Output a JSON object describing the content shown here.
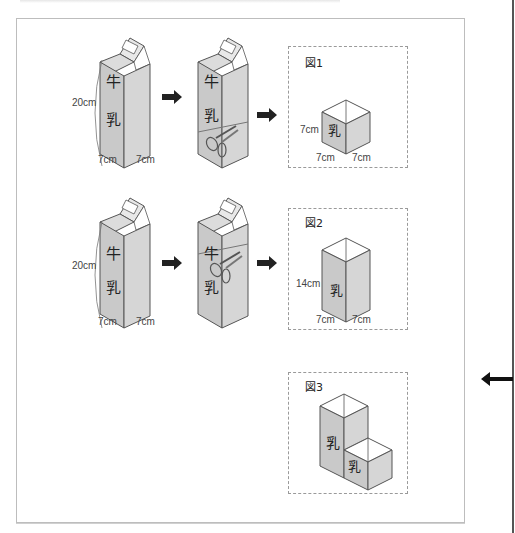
{
  "row1": {
    "carton_label_top": "牛",
    "carton_label_bottom": "乳",
    "height_label": "20cm",
    "width_left": "7cm",
    "width_right": "7cm",
    "figure": {
      "label": "図1",
      "height_label": "7cm",
      "width_left": "7cm",
      "width_right": "7cm",
      "carton_text": "乳"
    }
  },
  "row2": {
    "carton_label_top": "牛",
    "carton_label_bottom": "乳",
    "height_label": "20cm",
    "width_left": "7cm",
    "width_right": "7cm",
    "figure": {
      "label": "図2",
      "height_label": "14cm",
      "width_left": "7cm",
      "width_right": "7cm",
      "carton_text": "乳"
    }
  },
  "row3": {
    "figure": {
      "label": "図3",
      "tall_text": "乳",
      "short_text": "乳"
    }
  },
  "colors": {
    "carton_front": "#c9c9c9",
    "carton_side": "#d8d8d8",
    "outline": "#555555",
    "arrow": "#222222",
    "frame_border": "#bdbdbd",
    "dashed_border": "#9a9a9a"
  },
  "icons": {
    "step_arrow": "right-arrow",
    "margin_arrow": "left-arrow",
    "scissors": "scissors"
  }
}
